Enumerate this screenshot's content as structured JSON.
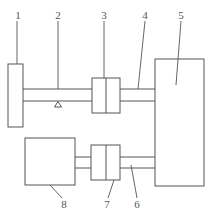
{
  "diagram": {
    "type": "mechanical-schematic",
    "labels": {
      "l1": "1",
      "l2": "2",
      "l3": "3",
      "l4": "4",
      "l5": "5",
      "l6": "6",
      "l7": "7",
      "l8": "8"
    },
    "components": [
      {
        "id": "1",
        "shape": "tall narrow rectangle (left)"
      },
      {
        "id": "2",
        "shape": "upper shaft with triangular support"
      },
      {
        "id": "3",
        "shape": "upper coupling (split rectangle)"
      },
      {
        "id": "4",
        "shape": "upper shaft segment to block 5"
      },
      {
        "id": "5",
        "shape": "large rectangle (right)"
      },
      {
        "id": "6",
        "shape": "lower shaft segment to block 5"
      },
      {
        "id": "7",
        "shape": "lower coupling (split rectangle)"
      },
      {
        "id": "8",
        "shape": "square block (lower left)"
      }
    ],
    "colors": {
      "stroke": "#555555",
      "background": "#ffffff"
    }
  }
}
